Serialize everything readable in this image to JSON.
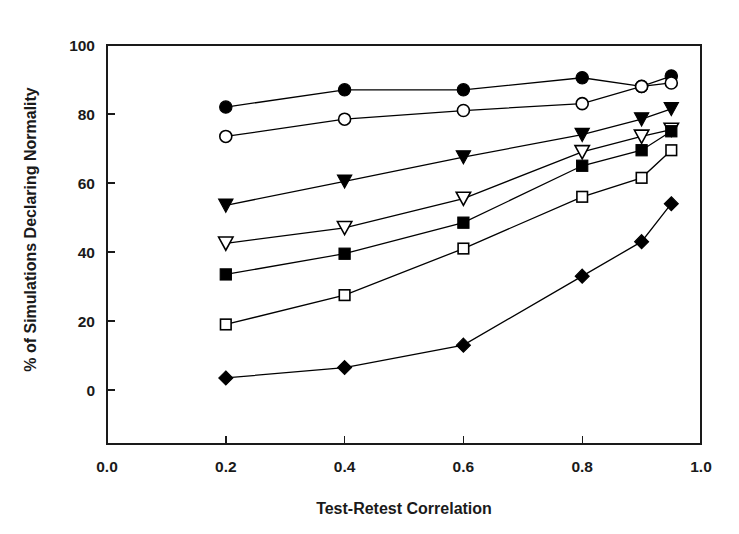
{
  "chart_data": {
    "type": "line",
    "title": "",
    "subtitle": "",
    "xlabel": "Test-Retest Correlation",
    "ylabel": "% of Simulations Declaring Normality",
    "xlim": [
      0.0,
      1.0
    ],
    "ylim": [
      0,
      100
    ],
    "grid": false,
    "legend_position": "none",
    "x_ticks": [
      "0.0",
      "0.2",
      "0.4",
      "0.6",
      "0.8",
      "1.0"
    ],
    "x_tick_values": [
      0.0,
      0.2,
      0.4,
      0.6,
      0.8,
      1.0
    ],
    "y_ticks": [
      "0",
      "20",
      "40",
      "60",
      "80",
      "100"
    ],
    "y_tick_values": [
      0,
      20,
      40,
      60,
      80,
      100
    ],
    "x": [
      0.2,
      0.4,
      0.6,
      0.8,
      0.9,
      0.95
    ],
    "series": [
      {
        "name": "filled-circle",
        "marker": "circle-filled",
        "values": [
          82,
          87,
          87,
          90.5,
          88,
          91
        ]
      },
      {
        "name": "open-circle",
        "marker": "circle-open",
        "values": [
          73.5,
          78.5,
          81,
          83,
          88,
          89
        ]
      },
      {
        "name": "filled-triangle-down",
        "marker": "triangle-down-filled",
        "values": [
          53.5,
          60.5,
          67.5,
          74,
          78.5,
          81.5
        ]
      },
      {
        "name": "open-triangle-down",
        "marker": "triangle-down-open",
        "values": [
          42.5,
          47,
          55.5,
          69,
          73.5,
          75.5
        ]
      },
      {
        "name": "filled-square",
        "marker": "square-filled",
        "values": [
          33.5,
          39.5,
          48.5,
          65,
          69.5,
          75
        ]
      },
      {
        "name": "open-square",
        "marker": "square-open",
        "values": [
          19,
          27.5,
          41,
          56,
          61.5,
          69.5
        ]
      },
      {
        "name": "filled-diamond",
        "marker": "diamond-filled",
        "values": [
          3.5,
          6.5,
          13,
          33,
          43,
          54
        ]
      }
    ]
  },
  "figure": {
    "background_color": "#ffffff",
    "axis_color": "#1a1a1a",
    "marker_color": "#000000"
  }
}
